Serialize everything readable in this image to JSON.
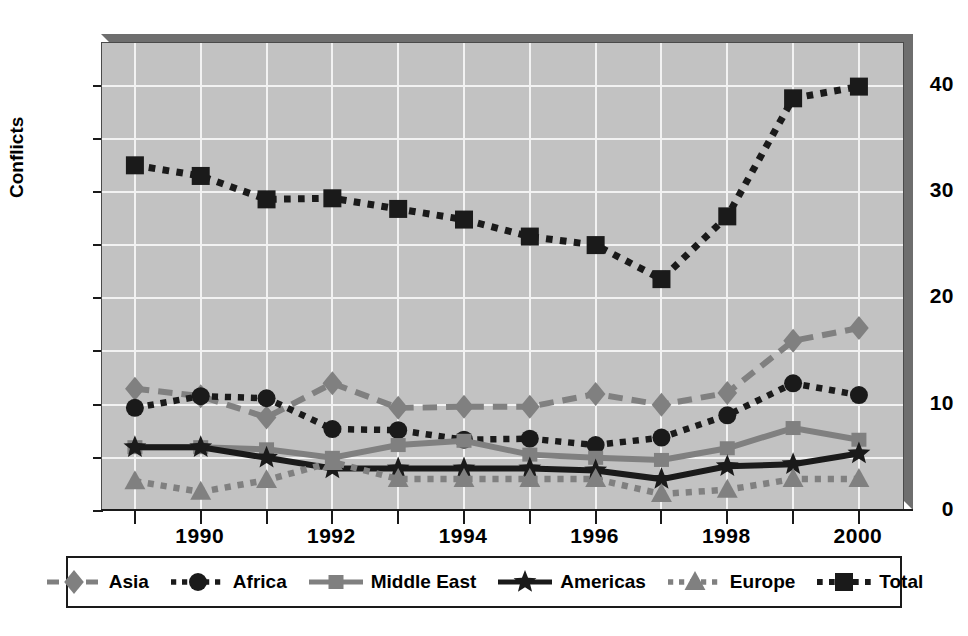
{
  "chart_data": {
    "type": "line",
    "title": "",
    "xlabel": "",
    "ylabel": "Conflicts",
    "x": [
      1989,
      1990,
      1991,
      1992,
      1993,
      1994,
      1995,
      1996,
      1997,
      1998,
      1999,
      2000
    ],
    "xlim": [
      1988.5,
      2000.7
    ],
    "ylim": [
      0,
      44
    ],
    "y_ticks_major": [
      0,
      10,
      20,
      30,
      40
    ],
    "y_ticks_minor": [
      5,
      15,
      25,
      35
    ],
    "x_tick_labels": [
      "1990",
      "1992",
      "1994",
      "1996",
      "1998",
      "2000"
    ],
    "x_tick_values": [
      1990,
      1992,
      1994,
      1996,
      1998,
      2000
    ],
    "grid": true,
    "legend_position": "below",
    "series": [
      {
        "name": "Asia",
        "color": "#808080",
        "dash": "dashed",
        "marker": "diamond",
        "values": [
          11.5,
          10.8,
          8.8,
          12.0,
          9.7,
          9.8,
          9.8,
          11.0,
          10.0,
          11.1,
          16.0,
          17.2
        ]
      },
      {
        "name": "Africa",
        "color": "#1a1a1a",
        "dash": "dotted",
        "marker": "circle",
        "values": [
          9.7,
          10.8,
          10.6,
          7.7,
          7.6,
          6.7,
          6.8,
          6.2,
          6.9,
          9.0,
          12.0,
          10.9
        ]
      },
      {
        "name": "Middle East",
        "color": "#808080",
        "dash": "solid",
        "marker": "square",
        "values": [
          6.0,
          6.0,
          5.8,
          5.0,
          6.2,
          6.6,
          5.3,
          5.0,
          4.8,
          5.9,
          7.8,
          6.7
        ]
      },
      {
        "name": "Americas",
        "color": "#1a1a1a",
        "dash": "solid",
        "marker": "star",
        "values": [
          6.0,
          6.0,
          5.0,
          4.0,
          4.0,
          4.0,
          4.0,
          3.8,
          3.0,
          4.2,
          4.4,
          5.4
        ]
      },
      {
        "name": "Europe",
        "color": "#808080",
        "dash": "dotted",
        "marker": "triangle",
        "values": [
          2.8,
          1.8,
          2.9,
          4.6,
          3.0,
          3.0,
          3.0,
          3.0,
          1.6,
          2.0,
          3.0,
          3.0
        ]
      },
      {
        "name": "Total",
        "color": "#1a1a1a",
        "dash": "dotted",
        "marker": "bigsquare",
        "values": [
          32.5,
          31.5,
          29.3,
          29.4,
          28.4,
          27.4,
          25.8,
          25.0,
          21.8,
          27.7,
          38.8,
          39.9
        ]
      }
    ]
  },
  "axes": {
    "y_title": "Conflicts",
    "y_labels": [
      "40",
      "30",
      "20",
      "10",
      "0"
    ],
    "x_labels": [
      "1990",
      "1992",
      "1994",
      "1996",
      "1998",
      "2000"
    ]
  },
  "legend": {
    "items": [
      {
        "label": "Asia"
      },
      {
        "label": "Africa"
      },
      {
        "label": "Middle East"
      },
      {
        "label": "Americas"
      },
      {
        "label": "Europe"
      },
      {
        "label": "Total"
      }
    ]
  },
  "colors": {
    "plot_background": "#c2c2c2",
    "grid": "#f2f2f2",
    "frame": "#4a4a4a",
    "bevel": "#6e6e6e",
    "dark_series": "#1a1a1a",
    "gray_series": "#808080",
    "page_background": "#ffffff"
  }
}
